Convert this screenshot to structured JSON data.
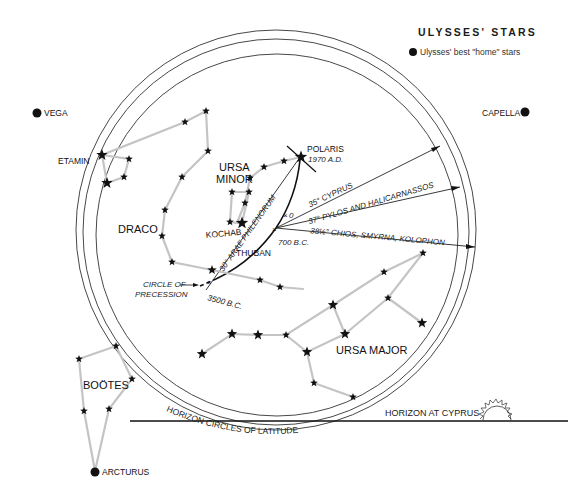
{
  "title": "ULYSSES' STARS",
  "legend": {
    "marker": "filled-circle",
    "label": "Ulysses' best \"home\" stars"
  },
  "home_stars": [
    {
      "name": "VEGA",
      "label_side": "right"
    },
    {
      "name": "CAPELLA",
      "label_side": "left"
    },
    {
      "name": "ARCTURUS",
      "label_side": "right"
    }
  ],
  "constellations": [
    {
      "name": "DRACO"
    },
    {
      "name": "URSA MINOR",
      "lines": [
        "URSA",
        "MINOR"
      ]
    },
    {
      "name": "URSA MAJOR"
    },
    {
      "name": "BOÖTES"
    }
  ],
  "named_stars": {
    "etamin": "ETAMIN",
    "polaris": "POLARIS",
    "polaris_date": "1970 A.D.",
    "kochab": "KOCHAB",
    "thuban": "THUBAN"
  },
  "precession": {
    "label_line1": "CIRCLE OF",
    "label_line2": "PRECESSION",
    "date_3500": "3500 B.C.",
    "date_700": "700 B.C.",
    "zero_mark": "0",
    "arc_label": "30° ARAE PHILENORUM"
  },
  "latitude_rays": [
    {
      "label": "35° CYPRUS"
    },
    {
      "label": "37° PYLOS AND HALICARNASSOS"
    },
    {
      "label": "38½° CHIOS, SMYRNA, KOLOPHON"
    }
  ],
  "horizon": {
    "label": "HORIZON AT CYPRUS",
    "circles_label": "HORIZON CIRCLES OF LATITUDE",
    "sun_icon": "rising-sun"
  },
  "colors": {
    "ink": "#111111",
    "constellation_line": "#c4c4c4",
    "circle": "#333333"
  }
}
